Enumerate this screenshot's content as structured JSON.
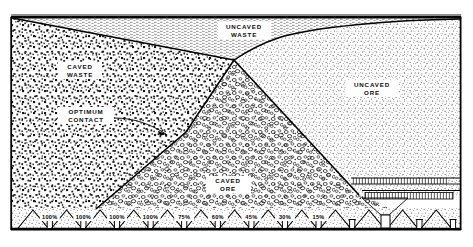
{
  "figure": {
    "border_color": "#000000",
    "background_color": "#ffffff"
  },
  "zones": [
    {
      "id": "caved-waste",
      "label_line1": "CAVED",
      "label_line2": "WASTE",
      "texture": "coarse-speckle",
      "label_x": 70,
      "label_y": 62
    },
    {
      "id": "uncaved-waste",
      "label_line1": "UNCAVED",
      "label_line2": "WASTE",
      "texture": "fine-hatch",
      "label_x": 234,
      "label_y": 24
    },
    {
      "id": "caved-ore",
      "label_line1": "CAVED",
      "label_line2": "ORE",
      "texture": "pebble-circles",
      "label_x": 218,
      "label_y": 178
    },
    {
      "id": "uncaved-ore",
      "label_line1": "UNCAVED",
      "label_line2": "ORE",
      "texture": "fine-stipple",
      "label_x": 362,
      "label_y": 82
    }
  ],
  "annotations": [
    {
      "id": "optimum-contact",
      "line1": "OPTIMUM",
      "line2": "CONTACT",
      "x": 80,
      "y": 111
    }
  ],
  "drawpoints": {
    "count": 13,
    "labels": [
      "100%",
      "100%",
      "100%",
      "100%",
      "75%",
      "60%",
      "45%",
      "30%",
      "15%",
      "",
      "",
      "",
      ""
    ],
    "label_y": 207,
    "first_x": 23,
    "spacing": 33.6
  },
  "colors": {
    "ink": "#000000",
    "paper": "#ffffff",
    "stipple_dark": "#1a1a1a",
    "stipple_light": "#6a6a6a"
  }
}
